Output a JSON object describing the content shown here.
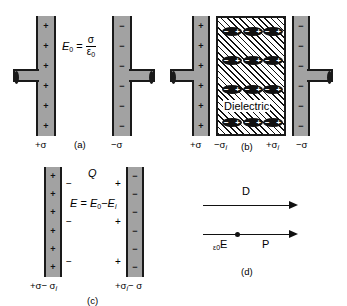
{
  "figure": {
    "background": "#ffffff",
    "plate_fill": "#a2a2a2",
    "ink": "#111111"
  },
  "panel_a": {
    "caption": "(a)",
    "formula": {
      "lhs": "E",
      "lhs_sub": "0",
      "equals": "=",
      "numerator": "σ",
      "denominator": "ε",
      "denominator_sub": "0"
    },
    "left_plate": {
      "charge_label": "+σ",
      "signs": [
        "+",
        "+",
        "+",
        "+",
        "+",
        "+"
      ],
      "terminal": "left-terminal"
    },
    "right_plate": {
      "charge_label": "−σ",
      "signs": [
        "−",
        "−",
        "−",
        "−",
        "−",
        "−"
      ],
      "terminal": "right-terminal"
    }
  },
  "panel_b": {
    "caption": "(b)",
    "dielectric_label": "Dielectric",
    "left_plate": {
      "charge_label": "+σ",
      "signs": [
        "+",
        "+",
        "+",
        "+",
        "+",
        "+"
      ]
    },
    "right_plate": {
      "charge_label": "−σ",
      "signs": [
        "−",
        "−",
        "−",
        "−",
        "−",
        "−"
      ]
    },
    "dielectric_left_label": {
      "sign": "−σ",
      "sub": "i"
    },
    "dielectric_right_label": {
      "sign": "+σ",
      "sub": "i"
    },
    "dipole": {
      "negative": "−",
      "positive": "+"
    },
    "dipole_rows": 4,
    "dipole_cols": 3
  },
  "panel_c": {
    "caption": "(c)",
    "charge_symbol": "Q",
    "formula": {
      "lhs": "E",
      "equals": "=",
      "term1": "E",
      "term1_sub": "0",
      "minus": "−",
      "term2": "E",
      "term2_sub": "i"
    },
    "left_plate": {
      "signs": [
        "+",
        "+",
        "+",
        "+",
        "+",
        "+"
      ],
      "charge_label_main": "+σ− σ",
      "charge_label_sub": "i"
    },
    "right_plate": {
      "signs": [
        "−",
        "−",
        "−",
        "−",
        "−",
        "−"
      ],
      "charge_label_main": "+σ",
      "charge_label_sub": "i",
      "charge_label_tail": "− σ"
    },
    "inner_negative_marks": [
      "−",
      "−",
      "−"
    ],
    "inner_positive_marks": [
      "+",
      "+",
      "+"
    ]
  },
  "panel_d": {
    "caption": "(d)",
    "vector_top_label": "D",
    "vector_eps_e_label": "E",
    "vector_eps_e_prefix": "ε",
    "vector_eps_e_prefix_sub": "0",
    "vector_p_label": "P"
  }
}
